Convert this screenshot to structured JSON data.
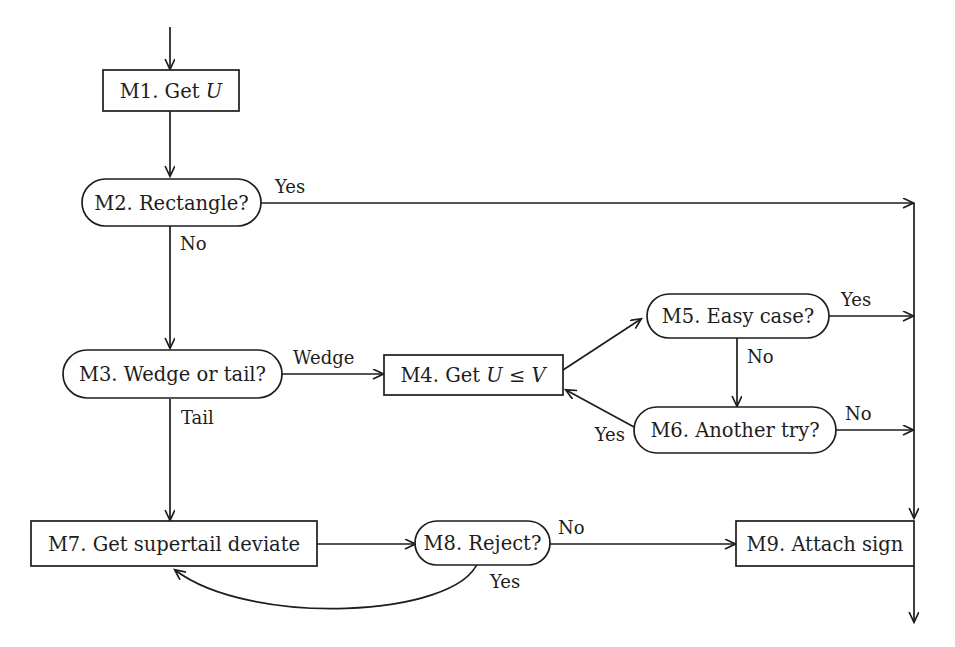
{
  "diagram": {
    "stroke_color": "#1d1d1d",
    "background_color": "#ffffff",
    "nodes": [
      {
        "id": "M1",
        "shape": "rect",
        "label_pre": "M1. Get ",
        "label_var": "U",
        "label_post": "",
        "label": "M1. Get U"
      },
      {
        "id": "M2",
        "shape": "stadium",
        "label_pre": "M2. Rectangle?",
        "label_var": "",
        "label_post": "",
        "label": "M2. Rectangle?"
      },
      {
        "id": "M3",
        "shape": "stadium",
        "label_pre": "M3. Wedge or tail?",
        "label_var": "",
        "label_post": "",
        "label": "M3. Wedge or tail?"
      },
      {
        "id": "M4",
        "shape": "rect",
        "label_pre": "M4. Get ",
        "label_var": "U",
        "label_post": " ≤ ",
        "label_var2": "V",
        "label": "M4. Get U ≤ V"
      },
      {
        "id": "M5",
        "shape": "stadium",
        "label_pre": "M5. Easy case?",
        "label_var": "",
        "label_post": "",
        "label": "M5. Easy case?"
      },
      {
        "id": "M6",
        "shape": "stadium",
        "label_pre": "M6. Another try?",
        "label_var": "",
        "label_post": "",
        "label": "M6. Another try?"
      },
      {
        "id": "M7",
        "shape": "rect",
        "label_pre": "M7. Get supertail deviate",
        "label_var": "",
        "label_post": "",
        "label": "M7. Get supertail deviate"
      },
      {
        "id": "M8",
        "shape": "stadium",
        "label_pre": "M8. Reject?",
        "label_var": "",
        "label_post": "",
        "label": "M8. Reject?"
      },
      {
        "id": "M9",
        "shape": "rect",
        "label_pre": "M9. Attach sign",
        "label_var": "",
        "label_post": "",
        "label": "M9. Attach sign"
      }
    ],
    "edge_labels": {
      "m2_yes": "Yes",
      "m2_no": "No",
      "m3_wedge": "Wedge",
      "m3_tail": "Tail",
      "m5_yes": "Yes",
      "m5_no": "No",
      "m6_no": "No",
      "m6_yes": "Yes",
      "m8_no": "No",
      "m8_yes": "Yes"
    }
  }
}
